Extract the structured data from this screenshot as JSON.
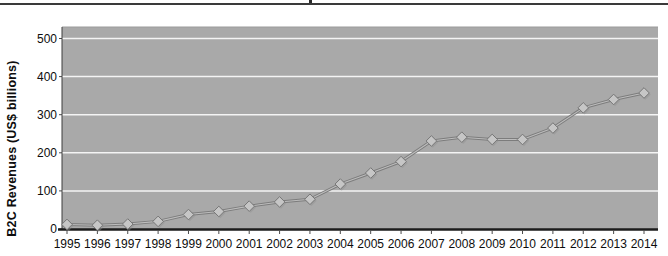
{
  "page": {
    "top_rule_color": "#3a3a3a",
    "background": "#ffffff"
  },
  "chart_data": {
    "type": "line",
    "title": "",
    "xlabel": "",
    "ylabel": "B2C Revenues (US$ billions)",
    "categories": [
      "1995",
      "1996",
      "1997",
      "1998",
      "1999",
      "2000",
      "2001",
      "2002",
      "2003",
      "2004",
      "2005",
      "2006",
      "2007",
      "2008",
      "2009",
      "2010",
      "2011",
      "2012",
      "2013",
      "2014"
    ],
    "series": [
      {
        "name": "B2C Revenues",
        "values": [
          12,
          10,
          13,
          20,
          38,
          46,
          60,
          71,
          78,
          118,
          147,
          177,
          231,
          241,
          235,
          235,
          265,
          318,
          340,
          357
        ]
      }
    ],
    "ylim": [
      0,
      530
    ],
    "y_ticks": [
      0,
      100,
      200,
      300,
      400,
      500
    ],
    "grid": "horizontal",
    "legend_position": "none",
    "marker": "diamond",
    "colors": {
      "plot_background": "#a9a9a9",
      "plot_top_edge": "#9b9b9b",
      "gridline": "#f4f4f4",
      "line": "#7c7c7c",
      "line_highlight": "#bdbdbd",
      "marker_fill": "#c6c6c6",
      "marker_stroke": "#767676",
      "marker_shadow": "#8f8f8f",
      "axis": "#1c1c1c",
      "tick": "#4a4a4a",
      "text": "#0d0d0d"
    }
  }
}
